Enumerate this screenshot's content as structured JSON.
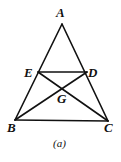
{
  "diagram": {
    "caption": "(a)",
    "points": {
      "A": {
        "label": "A",
        "x": 62,
        "y": 24
      },
      "B": {
        "label": "B",
        "x": 15,
        "y": 120
      },
      "C": {
        "label": "C",
        "x": 108,
        "y": 121
      },
      "D": {
        "label": "D",
        "x": 87,
        "y": 72
      },
      "E": {
        "label": "E",
        "x": 38,
        "y": 72
      },
      "G": {
        "label": "G",
        "x": 62,
        "y": 88
      }
    },
    "segments": [
      "AB",
      "AC",
      "BC",
      "ED",
      "EC",
      "DB"
    ]
  }
}
